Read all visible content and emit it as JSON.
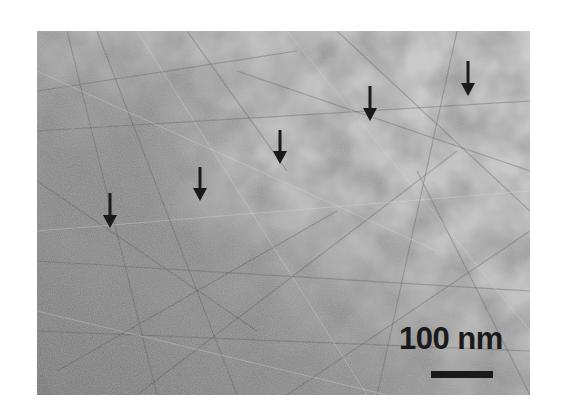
{
  "figure": {
    "type": "TEM micrograph",
    "colors": {
      "background": "#ffffff",
      "arrow": "#1a1a1a",
      "scale_bar": "#1a1a1a"
    },
    "arrows": [
      {
        "icon": "arrow-down-icon",
        "x": 110,
        "y_top": 193,
        "y_tip": 227
      },
      {
        "icon": "arrow-down-icon",
        "x": 200,
        "y_top": 167,
        "y_tip": 200
      },
      {
        "icon": "arrow-down-icon",
        "x": 280,
        "y_top": 130,
        "y_tip": 163
      },
      {
        "icon": "arrow-down-icon",
        "x": 370,
        "y_top": 86,
        "y_tip": 120
      },
      {
        "icon": "arrow-down-icon",
        "x": 468,
        "y_top": 61,
        "y_tip": 95
      }
    ],
    "scale_bar": {
      "label": "100 nm",
      "length_px": 62
    }
  }
}
